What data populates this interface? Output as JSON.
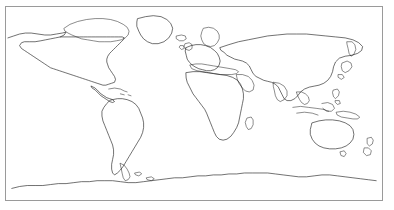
{
  "figure": {
    "title": "World Map Outline",
    "type": "map",
    "projection": "equirectangular",
    "background_color": "#ffffff",
    "coastline_color": "#1a1a1a",
    "frame_color": "#9a9a9a",
    "has_labels": false,
    "has_graticule": false,
    "has_legend": false,
    "frame": {
      "x": 5,
      "y": 6,
      "width": 378,
      "height": 195
    },
    "extent": {
      "lon_min": -180,
      "lon_max": 180,
      "lat_min": -90,
      "lat_max": 83
    }
  },
  "map_data": {
    "type": "coastline-outline",
    "regions": [
      {
        "name": "north-america",
        "label": "North America",
        "d": "M 2 32 L 8 30 L 14 28 L 20 27 L 26 27 L 33 28 L 40 29 L 46 29 L 52 28 L 58 27 L 62 26 L 60 29 L 56 31 L 51 32 L 46 33 L 41 34 L 36 35 L 30 36 L 24 36 L 19 36 L 16 37 L 14 40 L 16 43 L 19 45 L 22 47 L 25 49 L 28 51 L 31 53 L 34 55 L 37 57 L 40 59 L 43 61 L 46 63 L 49 64 L 52 65 L 55 66 L 58 67 L 61 68 L 64 69 L 67 70 L 70 71 L 73 72 L 76 73 L 79 74 L 82 75 L 85 76 L 88 77 L 91 78 L 94 79 L 97 80 L 100 81 L 103 81 L 106 80 L 109 79 L 112 78 L 113 75 L 112 72 L 110 69 L 108 66 L 106 63 L 105 60 L 104 57 L 104 54 L 105 51 L 107 48 L 109 46 L 111 44 L 113 42 L 115 40 L 117 38 L 119 36 L 121 34 L 122 32 L 120 31 L 116 31 L 112 31 L 108 31 L 104 31 L 100 31 L 96 31 L 92 31 L 88 31 L 84 31 L 80 31 L 76 31 L 72 31 L 68 31 L 64 31 L 60 31 L 56 31"
      },
      {
        "name": "canada-arctic",
        "label": "Canadian Arctic Archipelago",
        "d": "M 60 22 L 66 18 L 74 15 L 83 13 L 92 12 L 100 12 L 108 13 L 115 15 L 121 18 L 125 21 L 127 25 L 126 29 L 123 32 L 119 34 L 114 35 L 108 36 L 102 36 L 96 36 L 90 35 L 84 34 L 78 33 L 73 31 L 68 29 L 64 27 L 61 25 Z"
      },
      {
        "name": "greenland",
        "label": "Greenland",
        "d": "M 136 12 L 144 10 L 152 9 L 160 10 L 166 13 L 170 17 L 172 22 L 171 27 L 168 32 L 163 36 L 157 38 L 151 38 L 146 36 L 142 33 L 139 29 L 137 25 L 135 20 L 135 16 Z"
      },
      {
        "name": "iceland",
        "label": "Iceland",
        "d": "M 176 30 L 181 29 L 185 30 L 186 33 L 183 35 L 179 35 L 176 33 Z"
      },
      {
        "name": "central-america",
        "label": "Central America",
        "d": "M 88 82 L 92 84 L 95 87 L 98 90 L 101 92 L 104 94 L 107 95 L 110 96 L 112 98 L 110 99 L 107 98 L 104 96 L 101 94 L 98 92 L 95 89 L 92 86 L 89 84 Z"
      },
      {
        "name": "caribbean",
        "label": "Caribbean Islands",
        "d": "M 106 85 L 112 84 L 118 85 L 122 87 L 125 88 M 118 90 L 122 91 M 126 91 L 129 92"
      },
      {
        "name": "south-america",
        "label": "South America",
        "d": "M 110 96 L 115 95 L 120 95 L 125 96 L 130 98 L 134 101 L 137 105 L 139 110 L 141 115 L 142 120 L 142 125 L 141 130 L 139 135 L 136 140 L 133 145 L 130 150 L 127 155 L 124 160 L 121 165 L 118 169 L 115 172 L 112 174 L 110 172 L 109 168 L 109 163 L 110 158 L 111 153 L 111 148 L 110 143 L 108 138 L 106 133 L 104 128 L 102 123 L 100 118 L 99 113 L 99 108 L 101 104 L 104 100 L 107 97 Z"
      },
      {
        "name": "europe",
        "label": "Europe",
        "d": "M 186 42 L 191 40 L 196 39 L 201 39 L 206 40 L 211 42 L 215 45 L 218 48 L 220 52 L 221 56 L 220 60 L 218 63 L 215 65 L 211 66 L 207 66 L 203 65 L 199 64 L 195 62 L 192 60 L 189 57 L 187 54 L 186 50 L 185 46 Z"
      },
      {
        "name": "scandinavia",
        "label": "Scandinavia",
        "d": "M 204 22 L 209 21 L 214 22 L 218 25 L 220 29 L 220 33 L 218 37 L 215 40 L 211 41 L 207 40 L 204 38 L 202 34 L 201 30 L 202 26 Z"
      },
      {
        "name": "british-isles",
        "label": "British Isles",
        "d": "M 185 38 L 189 37 L 192 39 L 192 43 L 189 45 L 186 44 L 184 41 Z M 180 40 L 183 40 L 184 43 L 181 44 L 179 42 Z"
      },
      {
        "name": "mediterranean",
        "label": "Mediterranean Basin",
        "d": "M 190 60 L 196 59 L 202 59 L 208 60 L 214 61 L 220 62 L 226 63 L 232 64 L 237 65 L 240 67 L 238 69 L 233 70 L 227 70 L 221 70 L 215 69 L 209 68 L 203 67 L 197 66 L 192 64 Z"
      },
      {
        "name": "africa",
        "label": "Africa",
        "d": "M 186 68 L 193 67 L 200 67 L 207 68 L 214 69 L 221 70 L 228 71 L 234 73 L 239 76 L 242 80 L 244 85 L 245 90 L 245 95 L 244 100 L 243 105 L 242 110 L 241 115 L 240 120 L 238 125 L 235 130 L 232 134 L 228 137 L 224 138 L 220 137 L 217 134 L 215 130 L 213 125 L 211 120 L 209 115 L 207 110 L 205 106 L 202 102 L 199 98 L 196 94 L 193 90 L 191 86 L 189 82 L 187 78 L 186 74 Z"
      },
      {
        "name": "madagascar",
        "label": "Madagascar",
        "d": "M 249 115 L 253 114 L 255 117 L 255 122 L 253 126 L 250 127 L 248 124 L 247 120 Z"
      },
      {
        "name": "arabia",
        "label": "Arabian Peninsula",
        "d": "M 238 70 L 244 70 L 250 72 L 254 76 L 256 81 L 255 86 L 251 88 L 247 87 L 244 84 L 241 80 L 239 76 Z"
      },
      {
        "name": "asia",
        "label": "Asia",
        "d": "M 221 42 L 230 39 L 240 36 L 250 34 L 260 32 L 270 30 L 280 29 L 290 28 L 300 28 L 310 28 L 320 29 L 330 30 L 340 31 L 350 32 L 358 34 L 364 37 L 368 41 L 367 45 L 363 48 L 357 50 L 350 51 L 344 53 L 340 57 L 338 62 L 337 67 L 335 72 L 332 76 L 328 79 L 323 81 L 318 82 L 313 83 L 308 85 L 304 88 L 301 92 L 298 95 L 294 97 L 290 97 L 287 95 L 285 91 L 283 87 L 281 83 L 278 80 L 274 78 L 270 77 L 266 76 L 262 74 L 258 72 L 255 69 L 253 65 L 251 61 L 248 58 L 244 56 L 240 55 L 236 54 L 232 52 L 228 50 L 225 47 L 222 45 Z"
      },
      {
        "name": "india",
        "label": "Indian Subcontinent",
        "d": "M 276 78 L 282 79 L 287 82 L 290 87 L 290 92 L 287 96 L 283 98 L 280 96 L 278 92 L 277 87 L 276 83 Z"
      },
      {
        "name": "japan",
        "label": "Japan",
        "d": "M 347 58 L 352 56 L 356 58 L 357 62 L 354 66 L 350 68 L 347 66 L 346 62 Z M 343 70 L 347 70 L 349 73 L 346 75 L 343 73 Z"
      },
      {
        "name": "kamchatka",
        "label": "Kamchatka",
        "d": "M 352 36 L 357 36 L 360 39 L 361 44 L 359 49 L 356 51 L 354 48 L 353 43 L 352 39 Z"
      },
      {
        "name": "southeast-asia",
        "label": "Southeast Asia",
        "d": "M 300 88 L 305 88 L 309 90 L 312 93 L 313 97 L 311 100 L 308 101 L 305 99 L 303 96 L 301 92 Z"
      },
      {
        "name": "indonesia",
        "label": "Indonesia",
        "d": "M 296 104 L 304 103 L 312 104 L 320 105 L 327 106 L 333 108 M 300 110 L 308 109 L 316 110 L 322 112 M 326 100 L 332 99 L 337 101 L 339 105 L 336 108 L 331 108 L 327 105"
      },
      {
        "name": "philippines",
        "label": "Philippines",
        "d": "M 338 86 L 342 85 L 344 88 L 343 92 L 340 95 L 338 93 L 337 89 Z M 340 97 L 344 97 L 345 100 L 342 101 L 340 99 Z"
      },
      {
        "name": "new-guinea",
        "label": "New Guinea",
        "d": "M 341 109 L 348 108 L 355 109 L 361 111 L 365 114 L 363 116 L 358 116 L 352 115 L 346 114 L 342 112 Z"
      },
      {
        "name": "australia",
        "label": "Australia",
        "d": "M 316 120 L 323 118 L 330 117 L 337 117 L 344 118 L 350 120 L 355 123 L 358 127 L 359 132 L 358 137 L 355 141 L 351 144 L 346 146 L 340 147 L 334 147 L 328 146 L 323 144 L 319 141 L 316 137 L 314 132 L 314 127 L 315 123 Z"
      },
      {
        "name": "tasmania",
        "label": "Tasmania",
        "d": "M 345 150 L 349 149 L 351 152 L 349 155 L 346 154 Z"
      },
      {
        "name": "new-zealand",
        "label": "New Zealand",
        "d": "M 373 136 L 377 135 L 379 138 L 378 142 L 375 144 L 373 142 Z M 370 146 L 374 146 L 377 149 L 376 153 L 372 154 L 369 151 Z"
      },
      {
        "name": "antarctica",
        "label": "Antarctica",
        "d": "M 6 188 L 14 186 L 22 185 L 30 185 L 38 185 L 46 184 L 54 183 L 62 183 L 70 182 L 78 181 L 86 181 L 94 180 L 102 180 L 110 180 L 118 181 L 126 182 L 134 182 L 142 181 L 150 180 L 158 179 L 166 178 L 174 177 L 182 177 L 190 176 L 198 175 L 206 175 L 214 174 L 222 174 L 230 173 L 238 173 L 246 172 L 254 172 L 262 172 L 270 172 L 278 173 L 286 174 L 294 175 L 302 176 L 310 176 L 318 175 L 326 174 L 334 174 L 342 175 L 350 176 L 358 177 L 366 178 L 374 179 L 382 180"
      },
      {
        "name": "antarctic-peninsula",
        "label": "Antarctic Peninsula",
        "d": "M 118 162 L 122 164 L 125 168 L 127 172 L 128 176 L 126 179 L 123 180 L 121 177 L 120 173 L 119 168 Z"
      },
      {
        "name": "south-georgia",
        "label": "South Georgia / Falklands",
        "d": "M 133 172 L 138 171 L 140 173 L 137 175 L 134 174 Z M 145 177 L 150 176 L 153 178 L 150 180 L 146 179 Z"
      }
    ]
  }
}
